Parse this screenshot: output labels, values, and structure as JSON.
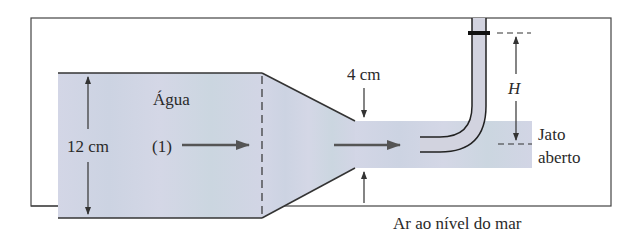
{
  "diagram": {
    "fluid_label": "Água",
    "section_label": "(1)",
    "large_diameter_label": "12 cm",
    "small_diameter_label": "4 cm",
    "height_label": "H",
    "jet_label_line1": "Jato",
    "jet_label_line2": "aberto",
    "ambient_label": "Ar ao nível do mar",
    "colors": {
      "water_fill": "#cfd4e3",
      "line": "#333333",
      "arrow": "#555555",
      "background": "#ffffff"
    }
  }
}
